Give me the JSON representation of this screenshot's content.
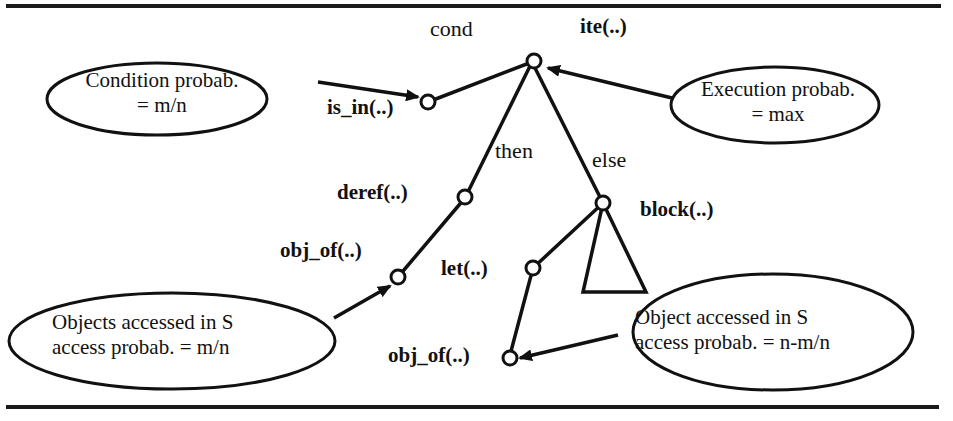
{
  "figure": {
    "tree": {
      "root": {
        "label": "ite(..)"
      },
      "edges": {
        "cond": "cond",
        "then": "then",
        "else": "else"
      },
      "nodes": {
        "is_in": "is_in(..)",
        "deref": "deref(..)",
        "obj_of_then": "obj_of(..)",
        "block": "block(..)",
        "let": "let(..)",
        "obj_of_else": "obj_of(..)"
      }
    },
    "annotations": {
      "condition": {
        "line1": "Condition probab.",
        "line2": "= m/n"
      },
      "execution": {
        "line1": "Execution probab.",
        "line2": "= max"
      },
      "objects_then": {
        "line1": "Objects accessed in S",
        "line2": "access probab. = m/n"
      },
      "object_else": {
        "line1": "Object accessed in S",
        "line2": "access probab. = n-m/n"
      }
    }
  }
}
